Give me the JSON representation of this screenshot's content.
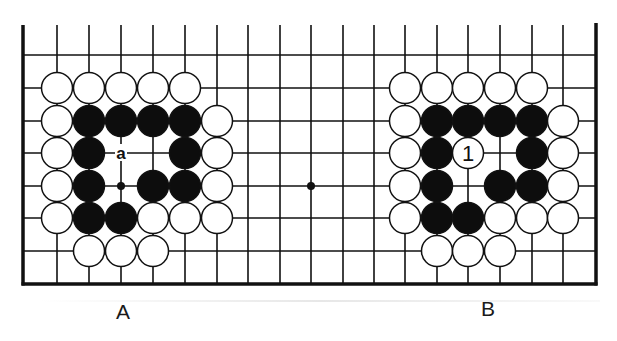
{
  "diagram": {
    "colors": {
      "line": "#111111",
      "black_stone": "#0d0d0d",
      "white_stone": "#ffffff",
      "background": "#ffffff"
    },
    "grid": {
      "x_columns": [
        57,
        89,
        121,
        153,
        185,
        217,
        248,
        280,
        311,
        343,
        374,
        405,
        437,
        468,
        500,
        532,
        563
      ],
      "y_rows": [
        55,
        88,
        121,
        153,
        186,
        218,
        251
      ],
      "top_edge": 25,
      "left_border": 23,
      "right_border": 596,
      "bottom_border": 284,
      "stone_radius": 15.5
    },
    "star_points": [
      {
        "c": 2,
        "r": 4
      },
      {
        "c": 8,
        "r": 4
      }
    ],
    "positions": [
      {
        "label": "A",
        "label_x": 123,
        "label_y": 300,
        "stones": [
          {
            "c": 0,
            "r": 1,
            "color": "white"
          },
          {
            "c": 1,
            "r": 1,
            "color": "white"
          },
          {
            "c": 2,
            "r": 1,
            "color": "white"
          },
          {
            "c": 3,
            "r": 1,
            "color": "white"
          },
          {
            "c": 4,
            "r": 1,
            "color": "white"
          },
          {
            "c": 0,
            "r": 2,
            "color": "white"
          },
          {
            "c": 1,
            "r": 2,
            "color": "black"
          },
          {
            "c": 2,
            "r": 2,
            "color": "black"
          },
          {
            "c": 3,
            "r": 2,
            "color": "black"
          },
          {
            "c": 4,
            "r": 2,
            "color": "black"
          },
          {
            "c": 5,
            "r": 2,
            "color": "white"
          },
          {
            "c": 0,
            "r": 3,
            "color": "white"
          },
          {
            "c": 1,
            "r": 3,
            "color": "black"
          },
          {
            "c": 4,
            "r": 3,
            "color": "black"
          },
          {
            "c": 5,
            "r": 3,
            "color": "white"
          },
          {
            "c": 0,
            "r": 4,
            "color": "white"
          },
          {
            "c": 1,
            "r": 4,
            "color": "black"
          },
          {
            "c": 3,
            "r": 4,
            "color": "black"
          },
          {
            "c": 4,
            "r": 4,
            "color": "black"
          },
          {
            "c": 5,
            "r": 4,
            "color": "white"
          },
          {
            "c": 0,
            "r": 5,
            "color": "white"
          },
          {
            "c": 1,
            "r": 5,
            "color": "black"
          },
          {
            "c": 2,
            "r": 5,
            "color": "black"
          },
          {
            "c": 3,
            "r": 5,
            "color": "white"
          },
          {
            "c": 4,
            "r": 5,
            "color": "white"
          },
          {
            "c": 5,
            "r": 5,
            "color": "white"
          },
          {
            "c": 1,
            "r": 6,
            "color": "white"
          },
          {
            "c": 2,
            "r": 6,
            "color": "white"
          },
          {
            "c": 3,
            "r": 6,
            "color": "white"
          }
        ],
        "point_labels": [
          {
            "c": 2,
            "r": 3,
            "text": "a"
          }
        ]
      },
      {
        "label": "B",
        "label_x": 488,
        "label_y": 297,
        "stones": [
          {
            "c": 11,
            "r": 1,
            "color": "white"
          },
          {
            "c": 12,
            "r": 1,
            "color": "white"
          },
          {
            "c": 13,
            "r": 1,
            "color": "white"
          },
          {
            "c": 14,
            "r": 1,
            "color": "white"
          },
          {
            "c": 15,
            "r": 1,
            "color": "white"
          },
          {
            "c": 11,
            "r": 2,
            "color": "white"
          },
          {
            "c": 12,
            "r": 2,
            "color": "black"
          },
          {
            "c": 13,
            "r": 2,
            "color": "black"
          },
          {
            "c": 14,
            "r": 2,
            "color": "black"
          },
          {
            "c": 15,
            "r": 2,
            "color": "black"
          },
          {
            "c": 16,
            "r": 2,
            "color": "white"
          },
          {
            "c": 11,
            "r": 3,
            "color": "white"
          },
          {
            "c": 12,
            "r": 3,
            "color": "black"
          },
          {
            "c": 13,
            "r": 3,
            "color": "white",
            "number": "1"
          },
          {
            "c": 15,
            "r": 3,
            "color": "black"
          },
          {
            "c": 16,
            "r": 3,
            "color": "white"
          },
          {
            "c": 11,
            "r": 4,
            "color": "white"
          },
          {
            "c": 12,
            "r": 4,
            "color": "black"
          },
          {
            "c": 14,
            "r": 4,
            "color": "black"
          },
          {
            "c": 15,
            "r": 4,
            "color": "black"
          },
          {
            "c": 16,
            "r": 4,
            "color": "white"
          },
          {
            "c": 11,
            "r": 5,
            "color": "white"
          },
          {
            "c": 12,
            "r": 5,
            "color": "black"
          },
          {
            "c": 13,
            "r": 5,
            "color": "black"
          },
          {
            "c": 14,
            "r": 5,
            "color": "white"
          },
          {
            "c": 15,
            "r": 5,
            "color": "white"
          },
          {
            "c": 16,
            "r": 5,
            "color": "white"
          },
          {
            "c": 12,
            "r": 6,
            "color": "white"
          },
          {
            "c": 13,
            "r": 6,
            "color": "white"
          },
          {
            "c": 14,
            "r": 6,
            "color": "white"
          }
        ],
        "point_labels": []
      }
    ]
  }
}
